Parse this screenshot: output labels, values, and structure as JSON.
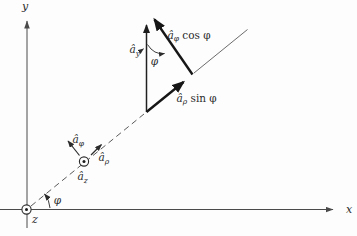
{
  "axes": {
    "x_label": "x",
    "y_label": "y",
    "z_label": "z"
  },
  "angles": {
    "origin_phi": "φ",
    "apex_phi": "φ"
  },
  "vectors": {
    "a_y": {
      "base": "â",
      "sub": "y"
    },
    "a_phi": {
      "base": "â",
      "sub": "φ"
    },
    "a_rho": {
      "base": "â",
      "sub": "ρ"
    },
    "a_z": {
      "base": "â",
      "sub": "z"
    },
    "a_phi_cos": {
      "base": "â",
      "sub": "φ",
      "suffix": " cos φ"
    },
    "a_rho_sin": {
      "base": "â",
      "sub": "ρ",
      "suffix": " sin φ"
    }
  },
  "colors": {
    "ink": "#2b2b2b",
    "axis": "#555555",
    "paper": "#fdfdfd"
  }
}
